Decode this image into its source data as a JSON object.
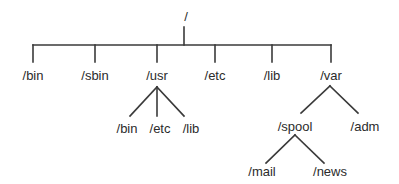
{
  "diagram": {
    "type": "directory-tree",
    "line_color": "#3a3a3a",
    "text_color": "#2b2b2b",
    "root": {
      "id": "root",
      "label": "/",
      "children": [
        {
          "id": "bin",
          "label": "/bin",
          "children": []
        },
        {
          "id": "sbin",
          "label": "/sbin",
          "children": []
        },
        {
          "id": "usr",
          "label": "/usr",
          "children": [
            {
              "id": "usr-bin",
              "label": "/bin",
              "children": []
            },
            {
              "id": "usr-etc",
              "label": "/etc",
              "children": []
            },
            {
              "id": "usr-lib",
              "label": "/lib",
              "children": []
            }
          ]
        },
        {
          "id": "etc",
          "label": "/etc",
          "children": []
        },
        {
          "id": "lib",
          "label": "/lib",
          "children": []
        },
        {
          "id": "var",
          "label": "/var",
          "children": [
            {
              "id": "var-spool",
              "label": "/spool",
              "children": [
                {
                  "id": "spool-mail",
                  "label": "/mail",
                  "children": []
                },
                {
                  "id": "spool-news",
                  "label": "/news",
                  "children": []
                }
              ]
            },
            {
              "id": "var-adm",
              "label": "/adm",
              "children": []
            }
          ]
        }
      ]
    }
  }
}
